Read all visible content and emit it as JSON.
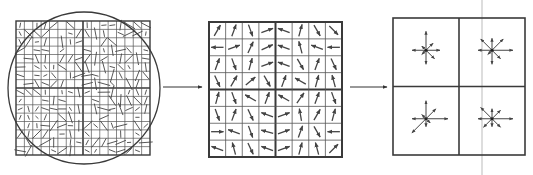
{
  "diagram": {
    "title": "",
    "colors": {
      "background": "#ffffff",
      "stroke": "#3a3a3a",
      "thin_grid": "#555555",
      "arrow": "#444444",
      "guide_line": "#bbbbbb"
    },
    "panels": [
      {
        "id": "input-patch",
        "description": "16x16 pixel grid with gradient samples and circular Gaussian window",
        "box": {
          "x": 16,
          "y": 21,
          "w": 134,
          "h": 134
        },
        "grid_cells": 16,
        "quadrant_divisions": 2,
        "circle": {
          "cx": 84,
          "cy": 88,
          "r": 76
        }
      },
      {
        "id": "gradient-grid",
        "description": "8x8 grid of gradient orientation arrows, split into 2x2 quadrants",
        "box": {
          "x": 209,
          "y": 22,
          "w": 133,
          "h": 135
        },
        "grid_cells": 8,
        "quadrant_divisions": 2,
        "arrow_angles_deg": [
          [
            60,
            70,
            -70,
            20,
            160,
            75,
            -60,
            -45
          ],
          [
            180,
            20,
            65,
            25,
            160,
            105,
            160,
            180
          ],
          [
            70,
            -70,
            75,
            20,
            160,
            -60,
            70,
            -65
          ],
          [
            -65,
            60,
            40,
            -60,
            70,
            150,
            75,
            105
          ],
          [
            75,
            -70,
            150,
            70,
            150,
            55,
            70,
            -70
          ],
          [
            -70,
            70,
            -65,
            160,
            20,
            100,
            60,
            75
          ],
          [
            0,
            160,
            -70,
            165,
            20,
            70,
            -60,
            180
          ],
          [
            160,
            105,
            -65,
            160,
            20,
            75,
            105,
            45
          ]
        ]
      },
      {
        "id": "descriptor",
        "description": "2x2 orientation histograms, 8 bins each",
        "box": {
          "x": 393,
          "y": 18,
          "w": 132,
          "h": 137
        },
        "cells": [
          {
            "bins": [
              14,
              10,
              19,
              6,
              14,
              6,
              14,
              12
            ]
          },
          {
            "bins": [
              21,
              16,
              12,
              16,
              14,
              6,
              14,
              12
            ]
          },
          {
            "bins": [
              22,
              14,
              18,
              6,
              14,
              20,
              8,
              6
            ]
          },
          {
            "bins": [
              21,
              12,
              10,
              16,
              14,
              12,
              8,
              12
            ]
          }
        ],
        "guide_line_x": 482
      }
    ],
    "arrows_between": [
      {
        "from": "input-patch",
        "to": "gradient-grid",
        "x1": 163,
        "x2": 202,
        "y": 87
      },
      {
        "from": "gradient-grid",
        "to": "descriptor",
        "x1": 350,
        "x2": 387,
        "y": 87
      }
    ]
  }
}
